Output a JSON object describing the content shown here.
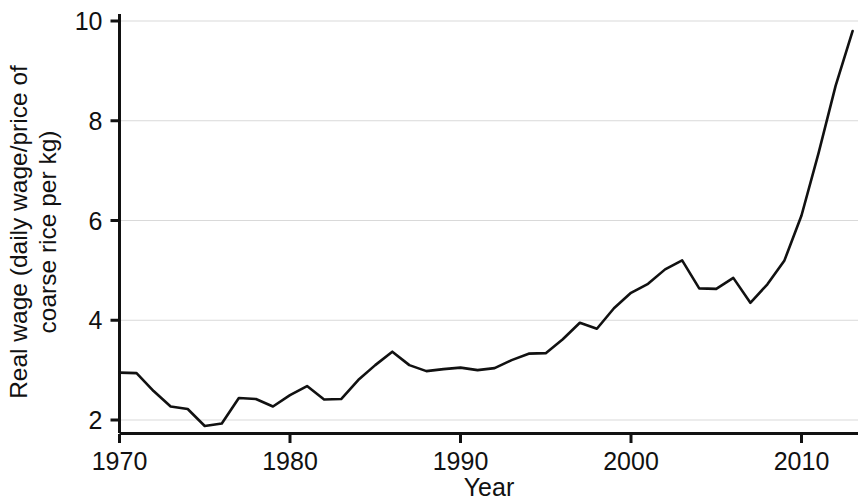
{
  "chart_data": {
    "type": "line",
    "title": "",
    "xlabel": "Year",
    "ylabel": "Real wage (daily wage/price of coarse rice per kg)",
    "ylabel_line1": "Real wage (daily wage/price of",
    "ylabel_line2": "coarse rice per kg)",
    "xlim": [
      1969.2,
      2013.6
    ],
    "ylim": [
      1.6,
      10.2
    ],
    "xticks": [
      1970,
      1980,
      1990,
      2000,
      2010
    ],
    "xtick_labels": [
      "1970",
      "1980",
      "1990",
      "2000",
      "2010"
    ],
    "yticks": [
      2,
      4,
      6,
      8,
      10
    ],
    "ytick_labels": [
      "2",
      "4",
      "6",
      "8",
      "10"
    ],
    "grid": "horizontal",
    "grid_color": "#d9d9d9",
    "line_color": "#111111",
    "line_width": 2.6,
    "legend": null,
    "x": [
      1970,
      1971,
      1972,
      1973,
      1974,
      1975,
      1976,
      1977,
      1978,
      1979,
      1980,
      1981,
      1982,
      1983,
      1984,
      1985,
      1986,
      1987,
      1988,
      1989,
      1990,
      1991,
      1992,
      1993,
      1994,
      1995,
      1996,
      1997,
      1998,
      1999,
      2000,
      2001,
      2002,
      2003,
      2004,
      2005,
      2006,
      2007,
      2008,
      2009,
      2010,
      2011,
      2012,
      2013
    ],
    "series": [
      {
        "name": "Real wage",
        "values": [
          2.95,
          2.94,
          2.58,
          2.27,
          2.22,
          1.88,
          1.93,
          2.44,
          2.42,
          2.27,
          2.5,
          2.68,
          2.41,
          2.42,
          2.8,
          3.1,
          3.37,
          3.1,
          2.98,
          3.02,
          3.05,
          3.0,
          3.04,
          3.2,
          3.33,
          3.34,
          3.62,
          3.95,
          3.83,
          4.24,
          4.55,
          4.73,
          5.02,
          5.2,
          4.64,
          4.63,
          4.85,
          4.35,
          4.72,
          5.2,
          6.1,
          7.35,
          8.7,
          9.8
        ]
      }
    ],
    "data_points": [
      {
        "year": 1970,
        "value": 2.95
      },
      {
        "year": 1971,
        "value": 2.94
      },
      {
        "year": 1972,
        "value": 2.58
      },
      {
        "year": 1973,
        "value": 2.27
      },
      {
        "year": 1974,
        "value": 2.22
      },
      {
        "year": 1975,
        "value": 1.88
      },
      {
        "year": 1976,
        "value": 1.93
      },
      {
        "year": 1977,
        "value": 2.44
      },
      {
        "year": 1978,
        "value": 2.42
      },
      {
        "year": 1979,
        "value": 2.27
      },
      {
        "year": 1980,
        "value": 2.5
      },
      {
        "year": 1981,
        "value": 2.68
      },
      {
        "year": 1982,
        "value": 2.41
      },
      {
        "year": 1983,
        "value": 2.42
      },
      {
        "year": 1984,
        "value": 2.8
      },
      {
        "year": 1985,
        "value": 3.1
      },
      {
        "year": 1986,
        "value": 3.37
      },
      {
        "year": 1987,
        "value": 3.1
      },
      {
        "year": 1988,
        "value": 2.98
      },
      {
        "year": 1989,
        "value": 3.02
      },
      {
        "year": 1990,
        "value": 3.05
      },
      {
        "year": 1991,
        "value": 3.0
      },
      {
        "year": 1992,
        "value": 3.04
      },
      {
        "year": 1993,
        "value": 3.2
      },
      {
        "year": 1994,
        "value": 3.33
      },
      {
        "year": 1995,
        "value": 3.34
      },
      {
        "year": 1996,
        "value": 3.62
      },
      {
        "year": 1997,
        "value": 3.95
      },
      {
        "year": 1998,
        "value": 3.83
      },
      {
        "year": 1999,
        "value": 4.24
      },
      {
        "year": 2000,
        "value": 4.55
      },
      {
        "year": 2001,
        "value": 4.73
      },
      {
        "year": 2002,
        "value": 5.02
      },
      {
        "year": 2003,
        "value": 5.2
      },
      {
        "year": 2004,
        "value": 4.64
      },
      {
        "year": 2005,
        "value": 4.63
      },
      {
        "year": 2006,
        "value": 4.85
      },
      {
        "year": 2007,
        "value": 4.35
      },
      {
        "year": 2008,
        "value": 4.72
      },
      {
        "year": 2009,
        "value": 5.2
      },
      {
        "year": 2010,
        "value": 6.1
      },
      {
        "year": 2011,
        "value": 7.35
      },
      {
        "year": 2012,
        "value": 8.7
      },
      {
        "year": 2013,
        "value": 9.8
      }
    ]
  }
}
